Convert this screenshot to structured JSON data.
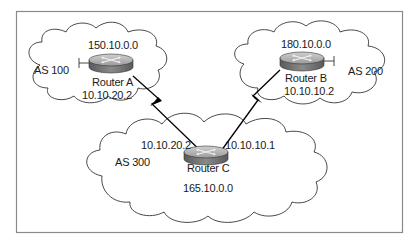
{
  "diagram": {
    "type": "network-topology",
    "autonomous_systems": [
      {
        "id": "as100",
        "label": "AS 100",
        "network": "150.10.0.0",
        "router": "Router A"
      },
      {
        "id": "as200",
        "label": "AS 200",
        "network": "180.10.0.0",
        "router": "Router B"
      },
      {
        "id": "as300",
        "label": "AS 300",
        "network": "165.10.0.0",
        "router": "Router C"
      }
    ],
    "routers": [
      {
        "id": "A",
        "name": "Router A",
        "interface_ip": "10.10.20.2"
      },
      {
        "id": "B",
        "name": "Router B",
        "interface_ip": "10.10.10.2"
      },
      {
        "id": "C",
        "name": "Router C",
        "interface_ips": [
          "10.10.20.2",
          "10.10.10.1"
        ]
      }
    ],
    "links": [
      {
        "from": "Router A",
        "to": "Router C",
        "style": "serial-lightning"
      },
      {
        "from": "Router B",
        "to": "Router C",
        "style": "serial-lightning"
      }
    ],
    "colors": {
      "frame": "#8a8a8a",
      "cloud_stroke": "#333333",
      "router_top": "#b5b5b5",
      "router_side": "#6e6e6e",
      "link": "#000000"
    }
  },
  "labels": {
    "as100": "AS 100",
    "as200": "AS 200",
    "as300": "AS 300",
    "net_a": "150.10.0.0",
    "net_b": "180.10.0.0",
    "net_c": "165.10.0.0",
    "router_a": "Router A",
    "router_b": "Router B",
    "router_c": "Router C",
    "ip_a": "10.10.20.2",
    "ip_b": "10.10.10.2",
    "ip_c_left": "10.10.20.2",
    "ip_c_right": "10.10.10.1"
  }
}
